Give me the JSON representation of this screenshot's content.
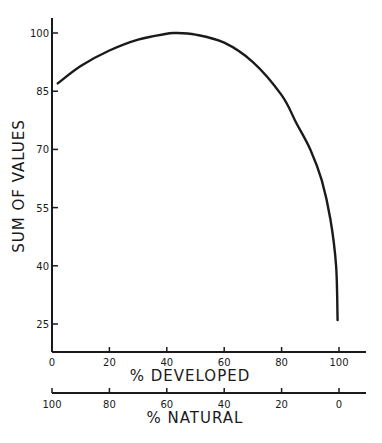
{
  "chart_data": {
    "type": "line",
    "title": "",
    "xlabel": "% DEVELOPED",
    "x2label": "% NATURAL",
    "ylabel": "SUM OF VALUES",
    "xlim": [
      0,
      100
    ],
    "ylim": [
      20,
      102
    ],
    "grid": false,
    "legend": null,
    "x_ticks": [
      "0",
      "20",
      "40",
      "60",
      "80",
      "100"
    ],
    "x2_ticks": [
      "100",
      "80",
      "60",
      "40",
      "20",
      "0"
    ],
    "y_ticks": [
      "25",
      "40",
      "55",
      "70",
      "85",
      "100"
    ],
    "series": [
      {
        "name": "Sum of values",
        "x": [
          2,
          10,
          20,
          30,
          40,
          43,
          50,
          60,
          70,
          80,
          85,
          90,
          94,
          97,
          99,
          99.5
        ],
        "y": [
          87,
          91.5,
          95.5,
          98.3,
          99.8,
          100,
          99.6,
          97.5,
          92.5,
          84,
          77,
          70,
          62,
          52,
          40,
          26
        ]
      }
    ]
  }
}
